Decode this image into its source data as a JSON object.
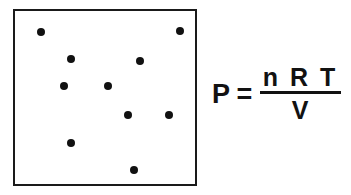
{
  "figure": {
    "title": "",
    "container": {
      "label": "gas-container",
      "border_color": "#1a1a1a",
      "fill_color": "#ffffff",
      "x": 13,
      "y": 9,
      "width": 184,
      "height": 177
    },
    "particles": {
      "label": "gas-particles",
      "count": 10,
      "color": "#111111",
      "diameter": 8,
      "points": [
        {
          "x": 26,
          "y": 21
        },
        {
          "x": 165,
          "y": 20
        },
        {
          "x": 56,
          "y": 48
        },
        {
          "x": 125,
          "y": 50
        },
        {
          "x": 49,
          "y": 75
        },
        {
          "x": 93,
          "y": 75
        },
        {
          "x": 113,
          "y": 104
        },
        {
          "x": 154,
          "y": 104
        },
        {
          "x": 56,
          "y": 132
        },
        {
          "x": 119,
          "y": 159
        }
      ]
    },
    "equation": {
      "name": "ideal-gas-law",
      "lhs": "P",
      "operator": "=",
      "numerator": "n R T",
      "denominator": "V",
      "text": "P = nRT / V",
      "color": "#121212"
    }
  },
  "chart_data": {
    "type": "scatter",
    "title": "",
    "subtitle": "",
    "xlabel": "",
    "ylabel": "",
    "grid": false,
    "legend": "none",
    "xlim": [
      0,
      184
    ],
    "ylim": [
      0,
      177
    ],
    "series": [
      {
        "name": "gas particles",
        "marker": "filled-circle",
        "color": "#111111",
        "size": 8,
        "x": [
          26,
          165,
          56,
          125,
          49,
          93,
          113,
          154,
          56,
          119
        ],
        "y": [
          21,
          20,
          48,
          50,
          75,
          75,
          104,
          104,
          132,
          159
        ]
      }
    ],
    "annotations": [
      {
        "text": "P = nRT / V",
        "x": 212,
        "y": 80
      }
    ]
  }
}
